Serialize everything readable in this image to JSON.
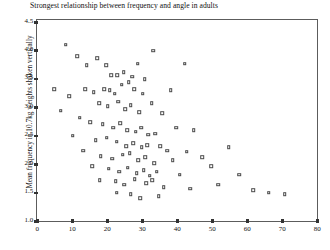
{
  "chart_data": {
    "type": "scatter",
    "title": "Strongest relationship between frequency and angle in adults",
    "xlabel": "",
    "ylabel": "Mean frequency in 10.7kg weights shaken vertically",
    "xlim": [
      0,
      80
    ],
    "ylim": [
      1.0,
      4.5
    ],
    "xticks": [
      0,
      10,
      20,
      30,
      40,
      50,
      60,
      70,
      80
    ],
    "yticks": [
      1.0,
      1.5,
      2.0,
      2.5,
      3.0,
      3.5,
      4.0,
      4.5
    ],
    "xtick_labels": [
      "0",
      "10",
      "20",
      "30",
      "40",
      "50",
      "60",
      "70",
      "80"
    ],
    "ytick_labels": [
      "1.0",
      "1.5",
      "2.0",
      "2.5",
      "3.0",
      "3.5",
      "4.0",
      "4.5"
    ],
    "grid": false,
    "legend": false,
    "marker": "open-square",
    "marker_color": "#4a4a4a",
    "points": [
      [
        8.5,
        4.08
      ],
      [
        14.5,
        3.72
      ],
      [
        20.0,
        3.72
      ],
      [
        23.2,
        3.55
      ],
      [
        29.0,
        3.75
      ],
      [
        33.5,
        3.98
      ],
      [
        11.8,
        3.88
      ],
      [
        17.5,
        3.85
      ],
      [
        21.5,
        3.55
      ],
      [
        25.0,
        3.6
      ],
      [
        27.5,
        3.52
      ],
      [
        31.0,
        3.48
      ],
      [
        5.2,
        3.3
      ],
      [
        9.5,
        3.18
      ],
      [
        14.0,
        3.3
      ],
      [
        16.5,
        3.25
      ],
      [
        19.5,
        3.3
      ],
      [
        21.0,
        3.28
      ],
      [
        22.5,
        3.22
      ],
      [
        24.5,
        3.38
      ],
      [
        26.5,
        3.42
      ],
      [
        28.0,
        3.3
      ],
      [
        30.5,
        3.22
      ],
      [
        38.5,
        3.28
      ],
      [
        42.5,
        3.75
      ],
      [
        7.0,
        2.92
      ],
      [
        12.5,
        2.8
      ],
      [
        18.0,
        3.05
      ],
      [
        20.5,
        3.0
      ],
      [
        23.5,
        3.08
      ],
      [
        25.5,
        2.95
      ],
      [
        27.0,
        3.02
      ],
      [
        29.5,
        2.9
      ],
      [
        33.0,
        3.05
      ],
      [
        36.0,
        2.88
      ],
      [
        15.5,
        2.72
      ],
      [
        19.0,
        2.68
      ],
      [
        22.0,
        2.62
      ],
      [
        24.0,
        2.7
      ],
      [
        26.0,
        2.58
      ],
      [
        28.5,
        2.55
      ],
      [
        30.0,
        2.62
      ],
      [
        32.0,
        2.5
      ],
      [
        34.0,
        2.52
      ],
      [
        40.0,
        2.62
      ],
      [
        45.0,
        2.58
      ],
      [
        10.5,
        2.48
      ],
      [
        17.0,
        2.4
      ],
      [
        20.2,
        2.45
      ],
      [
        23.0,
        2.38
      ],
      [
        25.8,
        2.3
      ],
      [
        27.8,
        2.35
      ],
      [
        30.2,
        2.28
      ],
      [
        31.8,
        2.32
      ],
      [
        35.5,
        2.3
      ],
      [
        37.5,
        2.22
      ],
      [
        43.0,
        2.2
      ],
      [
        13.5,
        2.22
      ],
      [
        18.5,
        2.12
      ],
      [
        21.8,
        2.08
      ],
      [
        24.8,
        2.15
      ],
      [
        26.8,
        2.18
      ],
      [
        29.2,
        2.05
      ],
      [
        31.2,
        2.1
      ],
      [
        33.8,
        2.0
      ],
      [
        39.0,
        2.05
      ],
      [
        47.5,
        2.1
      ],
      [
        16.0,
        1.95
      ],
      [
        20.8,
        1.9
      ],
      [
        23.8,
        1.85
      ],
      [
        26.2,
        1.92
      ],
      [
        28.8,
        1.82
      ],
      [
        30.8,
        1.88
      ],
      [
        32.5,
        1.78
      ],
      [
        34.5,
        1.85
      ],
      [
        41.0,
        1.8
      ],
      [
        50.0,
        1.95
      ],
      [
        55.0,
        2.28
      ],
      [
        18.2,
        1.7
      ],
      [
        22.8,
        1.68
      ],
      [
        25.2,
        1.62
      ],
      [
        28.2,
        1.72
      ],
      [
        31.5,
        1.65
      ],
      [
        33.2,
        1.7
      ],
      [
        36.5,
        1.58
      ],
      [
        44.0,
        1.55
      ],
      [
        52.0,
        1.62
      ],
      [
        58.0,
        1.8
      ],
      [
        62.0,
        1.52
      ],
      [
        66.5,
        1.48
      ],
      [
        71.0,
        1.45
      ],
      [
        23.0,
        1.48
      ],
      [
        27.0,
        1.45
      ],
      [
        35.0,
        1.42
      ],
      [
        29.8,
        1.38
      ]
    ]
  }
}
